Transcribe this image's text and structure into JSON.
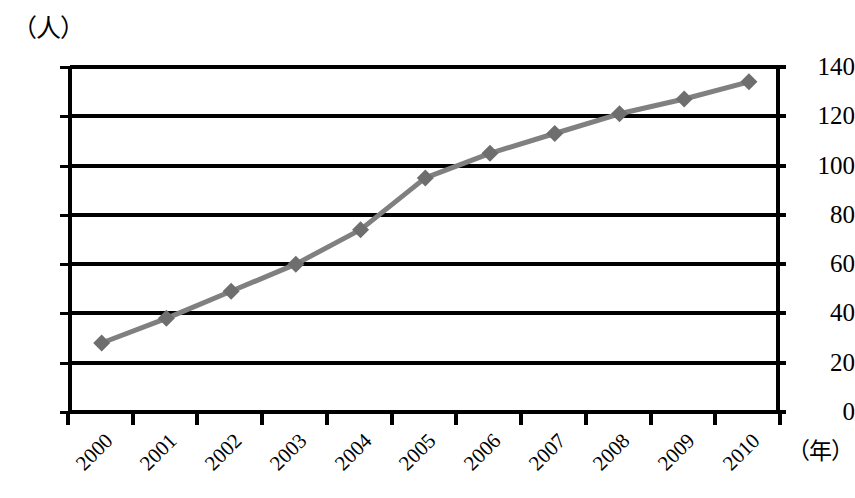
{
  "chart_data": {
    "type": "line",
    "title": "",
    "xlabel": "（年）",
    "ylabel": "（人）",
    "categories": [
      "2000",
      "2001",
      "2002",
      "2003",
      "2004",
      "2005",
      "2006",
      "2007",
      "2008",
      "2009",
      "2010"
    ],
    "values": [
      28,
      38,
      49,
      60,
      74,
      95,
      105,
      113,
      121,
      127,
      134
    ],
    "series": [
      {
        "name": "人数",
        "values": [
          28,
          38,
          49,
          60,
          74,
          95,
          105,
          113,
          121,
          127,
          134
        ],
        "color": "#808080",
        "marker": "diamond"
      }
    ],
    "ylim": [
      0,
      140
    ],
    "yticks": [
      0,
      20,
      40,
      60,
      80,
      100,
      120,
      140
    ],
    "ytick_labels": [
      "0",
      "20",
      "40",
      "60",
      "80",
      "100",
      "120",
      "140"
    ],
    "grid": true,
    "grid_axis": "y",
    "legend": "none",
    "xtick_rotation": -45
  },
  "axes": {
    "y_unit_label": "（人）",
    "x_unit_label": "（年）"
  },
  "colors": {
    "line": "#808080",
    "marker": "#6e6e6e",
    "axis": "#000000",
    "background": "#ffffff"
  },
  "caption": ""
}
